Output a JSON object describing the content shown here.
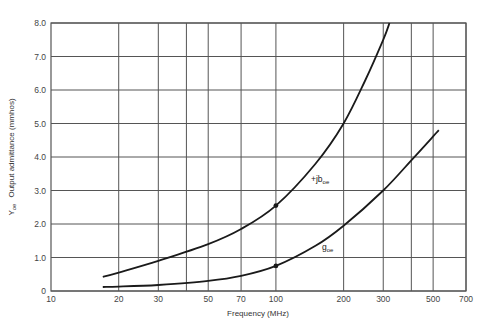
{
  "chart_data": {
    "type": "line",
    "title": "",
    "xlabel": "Frequency (MHz)",
    "ylabel_main": "Y",
    "ylabel_sub": "oe",
    "ylabel_rest": "Output admittance (mmhos)",
    "xscale": "log",
    "xlim": [
      10,
      700
    ],
    "ylim": [
      0,
      8.0
    ],
    "grid": true,
    "x_ticks": [
      10,
      20,
      30,
      50,
      70,
      100,
      200,
      300,
      500,
      700
    ],
    "x_tick_labels": [
      "10",
      "20",
      "30",
      "50",
      "70",
      "100",
      "200",
      "300",
      "500",
      "700"
    ],
    "x_gridlines": [
      20,
      30,
      40,
      50,
      70,
      100,
      200,
      300,
      400,
      500,
      700
    ],
    "y_ticks": [
      0,
      1.0,
      2.0,
      3.0,
      4.0,
      5.0,
      6.0,
      7.0,
      8.0
    ],
    "y_tick_labels": [
      "0",
      "1.0",
      "2.0",
      "3.0",
      "4.0",
      "5.0",
      "6.0",
      "7.0",
      "8.0"
    ],
    "series": [
      {
        "name": "+jb_oe",
        "label_main": "+jb",
        "label_sub": "oe",
        "x": [
          17,
          20,
          30,
          50,
          70,
          100,
          150,
          200,
          250,
          300,
          320
        ],
        "y": [
          0.42,
          0.55,
          0.9,
          1.4,
          1.85,
          2.55,
          3.8,
          5.0,
          6.3,
          7.5,
          8.0
        ],
        "marker_at": [
          100,
          2.55
        ]
      },
      {
        "name": "g_oe",
        "label_main": "g",
        "label_sub": "oe",
        "x": [
          17,
          20,
          30,
          50,
          70,
          100,
          150,
          200,
          300,
          400,
          530
        ],
        "y": [
          0.12,
          0.13,
          0.18,
          0.3,
          0.45,
          0.75,
          1.35,
          1.95,
          3.0,
          3.9,
          4.8
        ],
        "marker_at": [
          100,
          0.75
        ]
      }
    ],
    "legend": "none (inline curve labels)"
  },
  "colors": {
    "grid": "#555555",
    "curve": "#1a1a1a",
    "text": "#444444"
  }
}
